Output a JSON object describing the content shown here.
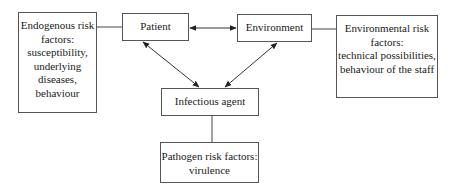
{
  "diagram": {
    "nodes": {
      "endogenous_risk": {
        "label": "Endogenous risk\nfactors:\nsusceptibility,\nunderlying\ndiseases,\nbehaviour"
      },
      "patient": {
        "label": "Patient"
      },
      "environment": {
        "label": "Environment"
      },
      "environmental_risk": {
        "label": "Environmental risk\nfactors:\ntechnical possibilities,\nbehaviour of the staff"
      },
      "infectious_agent": {
        "label": "Infectious agent"
      },
      "pathogen_risk": {
        "label": "Pathogen risk factors:\nvirulence"
      }
    },
    "edges": [
      {
        "from": "endogenous_risk",
        "to": "patient",
        "type": "line"
      },
      {
        "from": "patient",
        "to": "environment",
        "type": "bidirectional-arrow"
      },
      {
        "from": "environment",
        "to": "environmental_risk",
        "type": "line"
      },
      {
        "from": "patient",
        "to": "infectious_agent",
        "type": "bidirectional-arrow"
      },
      {
        "from": "environment",
        "to": "infectious_agent",
        "type": "bidirectional-arrow"
      },
      {
        "from": "infectious_agent",
        "to": "pathogen_risk",
        "type": "line"
      }
    ],
    "colors": {
      "line": "#333333",
      "border": "#555555",
      "background": "#ffffff"
    }
  }
}
